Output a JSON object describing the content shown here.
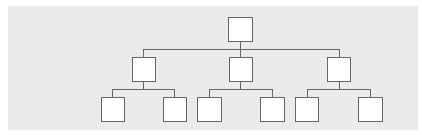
{
  "diagram": {
    "type": "tree",
    "title": "",
    "colors": {
      "background": "#ebebeb",
      "node_fill": "#ffffff",
      "stroke": "#666666"
    },
    "nodes": [
      {
        "id": "root",
        "label": "",
        "level": 0,
        "x": 228,
        "y": 17,
        "w": 25,
        "h": 25
      },
      {
        "id": "mid-left",
        "label": "",
        "level": 1,
        "x": 132,
        "y": 57,
        "w": 24,
        "h": 25
      },
      {
        "id": "mid-center",
        "label": "",
        "level": 1,
        "x": 229,
        "y": 57,
        "w": 24,
        "h": 25
      },
      {
        "id": "mid-right",
        "label": "",
        "level": 1,
        "x": 327,
        "y": 57,
        "w": 24,
        "h": 25
      },
      {
        "id": "leaf-1",
        "label": "",
        "level": 2,
        "x": 101,
        "y": 97,
        "w": 24,
        "h": 25
      },
      {
        "id": "leaf-2",
        "label": "",
        "level": 2,
        "x": 163,
        "y": 97,
        "w": 24,
        "h": 25
      },
      {
        "id": "leaf-3",
        "label": "",
        "level": 2,
        "x": 197,
        "y": 97,
        "w": 25,
        "h": 25
      },
      {
        "id": "leaf-4",
        "label": "",
        "level": 2,
        "x": 260,
        "y": 97,
        "w": 25,
        "h": 25
      },
      {
        "id": "leaf-5",
        "label": "",
        "level": 2,
        "x": 295,
        "y": 97,
        "w": 24,
        "h": 25
      },
      {
        "id": "leaf-6",
        "label": "",
        "level": 2,
        "x": 358,
        "y": 97,
        "w": 25,
        "h": 25
      }
    ],
    "edges": [
      {
        "from": "root",
        "to": "mid-left"
      },
      {
        "from": "root",
        "to": "mid-center"
      },
      {
        "from": "root",
        "to": "mid-right"
      },
      {
        "from": "mid-left",
        "to": "leaf-1"
      },
      {
        "from": "mid-left",
        "to": "leaf-2"
      },
      {
        "from": "mid-center",
        "to": "leaf-3"
      },
      {
        "from": "mid-center",
        "to": "leaf-4"
      },
      {
        "from": "mid-right",
        "to": "leaf-5"
      },
      {
        "from": "mid-right",
        "to": "leaf-6"
      }
    ]
  }
}
